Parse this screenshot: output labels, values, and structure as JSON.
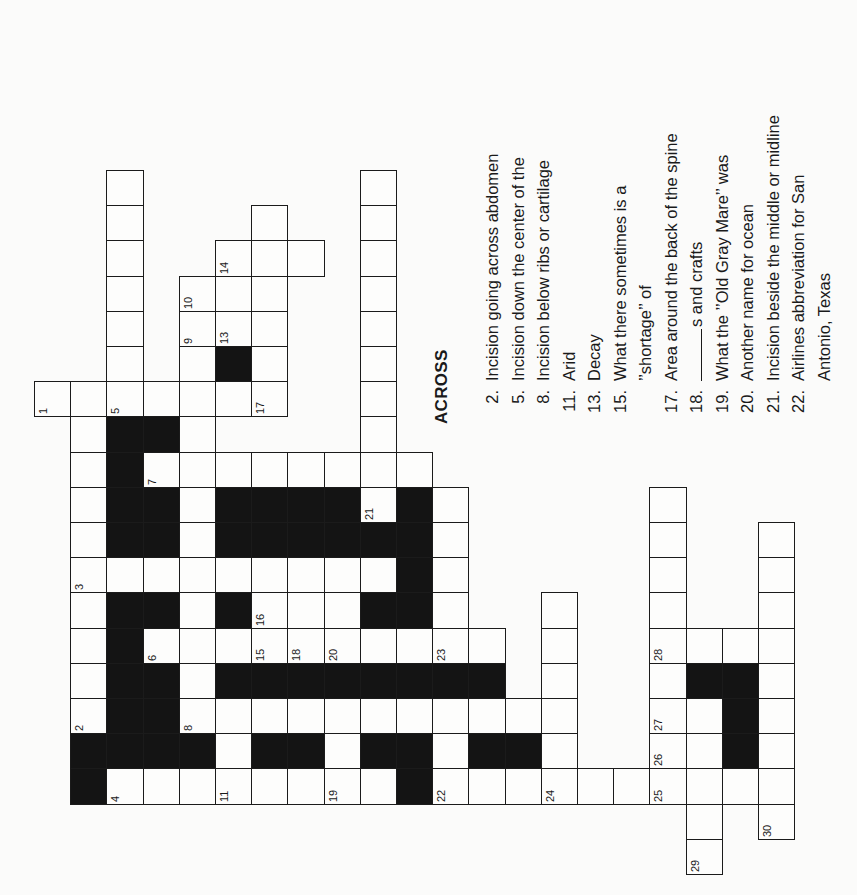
{
  "puzzle": {
    "type": "crossword",
    "orientation": "rotated-90-ccw",
    "colors": {
      "ink": "#1a1a1a",
      "black_square": "#141414",
      "paper": "#fbfbfa"
    },
    "grid_origin": {
      "x": 34,
      "y": 170,
      "col_w": 36.2,
      "row_h": 35.2
    },
    "cells": [
      {
        "c": 2,
        "r": 0
      },
      {
        "c": 2,
        "r": 1
      },
      {
        "c": 2,
        "r": 2
      },
      {
        "c": 2,
        "r": 3
      },
      {
        "c": 2,
        "r": 4
      },
      {
        "c": 2,
        "r": 5
      },
      {
        "c": 9,
        "r": 0
      },
      {
        "c": 9,
        "r": 1
      },
      {
        "c": 9,
        "r": 2
      },
      {
        "c": 9,
        "r": 3
      },
      {
        "c": 9,
        "r": 4
      },
      {
        "c": 9,
        "r": 5
      },
      {
        "c": 9,
        "r": 6
      },
      {
        "c": 9,
        "r": 7
      },
      {
        "c": 6,
        "r": 1
      },
      {
        "c": 5,
        "r": 2,
        "n": "14"
      },
      {
        "c": 6,
        "r": 2
      },
      {
        "c": 7,
        "r": 2
      },
      {
        "c": 4,
        "r": 3,
        "n": "10"
      },
      {
        "c": 5,
        "r": 3
      },
      {
        "c": 6,
        "r": 3
      },
      {
        "c": 4,
        "r": 4,
        "n": "9"
      },
      {
        "c": 5,
        "r": 4,
        "n": "13"
      },
      {
        "c": 6,
        "r": 4
      },
      {
        "c": 4,
        "r": 5
      },
      {
        "c": 5,
        "r": 5,
        "b": 1
      },
      {
        "c": 6,
        "r": 5
      },
      {
        "c": 0,
        "r": 6,
        "n": "1"
      },
      {
        "c": 1,
        "r": 6
      },
      {
        "c": 2,
        "r": 6,
        "n": "5"
      },
      {
        "c": 3,
        "r": 6
      },
      {
        "c": 4,
        "r": 6
      },
      {
        "c": 5,
        "r": 6
      },
      {
        "c": 6,
        "r": 6,
        "n": "17"
      },
      {
        "c": 1,
        "r": 7
      },
      {
        "c": 2,
        "r": 7,
        "b": 1
      },
      {
        "c": 3,
        "r": 7,
        "b": 1
      },
      {
        "c": 4,
        "r": 7
      },
      {
        "c": 1,
        "r": 8
      },
      {
        "c": 2,
        "r": 8,
        "b": 1
      },
      {
        "c": 3,
        "r": 8,
        "n": "7"
      },
      {
        "c": 4,
        "r": 8
      },
      {
        "c": 5,
        "r": 8
      },
      {
        "c": 6,
        "r": 8
      },
      {
        "c": 7,
        "r": 8
      },
      {
        "c": 8,
        "r": 8
      },
      {
        "c": 9,
        "r": 8
      },
      {
        "c": 10,
        "r": 8
      },
      {
        "c": 1,
        "r": 9
      },
      {
        "c": 2,
        "r": 9,
        "b": 1
      },
      {
        "c": 3,
        "r": 9,
        "b": 1
      },
      {
        "c": 4,
        "r": 9
      },
      {
        "c": 5,
        "r": 9,
        "b": 1
      },
      {
        "c": 6,
        "r": 9,
        "b": 1
      },
      {
        "c": 7,
        "r": 9,
        "b": 1
      },
      {
        "c": 8,
        "r": 9,
        "b": 1
      },
      {
        "c": 9,
        "r": 9,
        "n": "21"
      },
      {
        "c": 10,
        "r": 9,
        "b": 1
      },
      {
        "c": 11,
        "r": 9
      },
      {
        "c": 1,
        "r": 10
      },
      {
        "c": 2,
        "r": 10,
        "b": 1
      },
      {
        "c": 3,
        "r": 10,
        "b": 1
      },
      {
        "c": 4,
        "r": 10
      },
      {
        "c": 5,
        "r": 10,
        "b": 1
      },
      {
        "c": 6,
        "r": 10,
        "b": 1
      },
      {
        "c": 7,
        "r": 10,
        "b": 1
      },
      {
        "c": 8,
        "r": 10,
        "b": 1
      },
      {
        "c": 9,
        "r": 10,
        "b": 1
      },
      {
        "c": 10,
        "r": 10,
        "b": 1
      },
      {
        "c": 11,
        "r": 10
      },
      {
        "c": 1,
        "r": 11,
        "n": "3"
      },
      {
        "c": 2,
        "r": 11
      },
      {
        "c": 3,
        "r": 11
      },
      {
        "c": 4,
        "r": 11
      },
      {
        "c": 5,
        "r": 11
      },
      {
        "c": 6,
        "r": 11
      },
      {
        "c": 7,
        "r": 11
      },
      {
        "c": 8,
        "r": 11
      },
      {
        "c": 9,
        "r": 11
      },
      {
        "c": 10,
        "r": 11,
        "b": 1
      },
      {
        "c": 11,
        "r": 11
      },
      {
        "c": 1,
        "r": 12
      },
      {
        "c": 2,
        "r": 12,
        "b": 1
      },
      {
        "c": 3,
        "r": 12,
        "b": 1
      },
      {
        "c": 4,
        "r": 12
      },
      {
        "c": 5,
        "r": 12,
        "b": 1
      },
      {
        "c": 6,
        "r": 12,
        "n": "16"
      },
      {
        "c": 7,
        "r": 12
      },
      {
        "c": 8,
        "r": 12
      },
      {
        "c": 9,
        "r": 12,
        "b": 1
      },
      {
        "c": 10,
        "r": 12,
        "b": 1
      },
      {
        "c": 11,
        "r": 12
      },
      {
        "c": 14,
        "r": 12
      },
      {
        "c": 1,
        "r": 13
      },
      {
        "c": 2,
        "r": 13,
        "b": 1
      },
      {
        "c": 3,
        "r": 13,
        "n": "6"
      },
      {
        "c": 4,
        "r": 13
      },
      {
        "c": 5,
        "r": 13
      },
      {
        "c": 6,
        "r": 13,
        "n": "15"
      },
      {
        "c": 7,
        "r": 13,
        "n": "18"
      },
      {
        "c": 8,
        "r": 13,
        "n": "20"
      },
      {
        "c": 9,
        "r": 13
      },
      {
        "c": 10,
        "r": 13
      },
      {
        "c": 11,
        "r": 13,
        "n": "23"
      },
      {
        "c": 12,
        "r": 13
      },
      {
        "c": 14,
        "r": 13
      },
      {
        "c": 1,
        "r": 14
      },
      {
        "c": 2,
        "r": 14,
        "b": 1
      },
      {
        "c": 3,
        "r": 14,
        "b": 1
      },
      {
        "c": 4,
        "r": 14
      },
      {
        "c": 5,
        "r": 14,
        "b": 1
      },
      {
        "c": 6,
        "r": 14,
        "b": 1
      },
      {
        "c": 7,
        "r": 14,
        "b": 1
      },
      {
        "c": 8,
        "r": 14,
        "b": 1
      },
      {
        "c": 9,
        "r": 14,
        "b": 1
      },
      {
        "c": 10,
        "r": 14,
        "b": 1
      },
      {
        "c": 11,
        "r": 14,
        "b": 1
      },
      {
        "c": 12,
        "r": 14,
        "b": 1
      },
      {
        "c": 14,
        "r": 14
      },
      {
        "c": 1,
        "r": 15,
        "n": "2"
      },
      {
        "c": 2,
        "r": 15,
        "b": 1
      },
      {
        "c": 3,
        "r": 15,
        "b": 1
      },
      {
        "c": 4,
        "r": 15,
        "n": "8"
      },
      {
        "c": 5,
        "r": 15
      },
      {
        "c": 6,
        "r": 15
      },
      {
        "c": 7,
        "r": 15
      },
      {
        "c": 8,
        "r": 15
      },
      {
        "c": 9,
        "r": 15
      },
      {
        "c": 10,
        "r": 15
      },
      {
        "c": 11,
        "r": 15
      },
      {
        "c": 12,
        "r": 15
      },
      {
        "c": 13,
        "r": 15
      },
      {
        "c": 14,
        "r": 15
      },
      {
        "c": 1,
        "r": 16,
        "b": 1
      },
      {
        "c": 2,
        "r": 16,
        "b": 1
      },
      {
        "c": 3,
        "r": 16,
        "b": 1
      },
      {
        "c": 4,
        "r": 16,
        "b": 1
      },
      {
        "c": 5,
        "r": 16
      },
      {
        "c": 6,
        "r": 16,
        "b": 1
      },
      {
        "c": 7,
        "r": 16,
        "b": 1
      },
      {
        "c": 8,
        "r": 16
      },
      {
        "c": 9,
        "r": 16,
        "b": 1
      },
      {
        "c": 10,
        "r": 16,
        "b": 1
      },
      {
        "c": 11,
        "r": 16
      },
      {
        "c": 12,
        "r": 16,
        "b": 1
      },
      {
        "c": 13,
        "r": 16,
        "b": 1
      },
      {
        "c": 14,
        "r": 16
      },
      {
        "c": 1,
        "r": 17,
        "b": 1
      },
      {
        "c": 2,
        "r": 17,
        "n": "4"
      },
      {
        "c": 3,
        "r": 17
      },
      {
        "c": 4,
        "r": 17
      },
      {
        "c": 5,
        "r": 17,
        "n": "11"
      },
      {
        "c": 6,
        "r": 17
      },
      {
        "c": 7,
        "r": 17
      },
      {
        "c": 8,
        "r": 17,
        "n": "19"
      },
      {
        "c": 9,
        "r": 17
      },
      {
        "c": 10,
        "r": 17,
        "b": 1
      },
      {
        "c": 11,
        "r": 17,
        "n": "22"
      },
      {
        "c": 12,
        "r": 17
      },
      {
        "c": 13,
        "r": 17
      },
      {
        "c": 14,
        "r": 17,
        "n": "24"
      },
      {
        "c": 15,
        "r": 17
      },
      {
        "c": 16,
        "r": 17
      },
      {
        "c": 17,
        "r": 17,
        "n": "25"
      },
      {
        "c": 18,
        "r": 17
      },
      {
        "c": 19,
        "r": 17
      },
      {
        "c": 20,
        "r": 17
      },
      {
        "c": 17,
        "r": 9
      },
      {
        "c": 17,
        "r": 10
      },
      {
        "c": 17,
        "r": 11
      },
      {
        "c": 17,
        "r": 12
      },
      {
        "c": 17,
        "r": 13,
        "n": "28"
      },
      {
        "c": 17,
        "r": 14
      },
      {
        "c": 17,
        "r": 15,
        "n": "27"
      },
      {
        "c": 17,
        "r": 16,
        "n": "26"
      },
      {
        "c": 18,
        "r": 13
      },
      {
        "c": 18,
        "r": 14,
        "b": 1
      },
      {
        "c": 18,
        "r": 15
      },
      {
        "c": 18,
        "r": 16
      },
      {
        "c": 19,
        "r": 13
      },
      {
        "c": 19,
        "r": 14,
        "b": 1
      },
      {
        "c": 19,
        "r": 15,
        "b": 1
      },
      {
        "c": 19,
        "r": 16,
        "b": 1
      },
      {
        "c": 20,
        "r": 10
      },
      {
        "c": 20,
        "r": 11
      },
      {
        "c": 20,
        "r": 12
      },
      {
        "c": 20,
        "r": 13
      },
      {
        "c": 20,
        "r": 14
      },
      {
        "c": 20,
        "r": 15
      },
      {
        "c": 20,
        "r": 16
      },
      {
        "c": 18,
        "r": 18
      },
      {
        "c": 20,
        "r": 18,
        "n": "30"
      },
      {
        "c": 18,
        "r": 19,
        "n": "29"
      }
    ]
  },
  "clues": {
    "heading": "ACROSS",
    "across": [
      {
        "num": "2.",
        "text": "Incision going across abdomen"
      },
      {
        "num": "5.",
        "text": "Incision down the center of the"
      },
      {
        "num": "8.",
        "text": "Incision below ribs or cartilage"
      },
      {
        "num": "11.",
        "text": "Arid"
      },
      {
        "num": "13.",
        "text": "Decay"
      },
      {
        "num": "15.",
        "text": "What there sometimes is a"
      },
      {
        "num": "",
        "text": "’’shortage’’ of",
        "continuation": true
      },
      {
        "num": "17.",
        "text": "Area around the back of the spine"
      },
      {
        "num": "18.",
        "text": "s and crafts",
        "blank": true
      },
      {
        "num": "19.",
        "text": "What the ’’Old Gray Mare’’ was"
      },
      {
        "num": "20.",
        "text": "Another name for ocean"
      },
      {
        "num": "21.",
        "text": "Incision beside the middle or midline"
      },
      {
        "num": "22.",
        "text": "Airlines abbreviation for San"
      },
      {
        "num": "",
        "text": "Antonio, Texas",
        "continuation": true
      }
    ]
  }
}
